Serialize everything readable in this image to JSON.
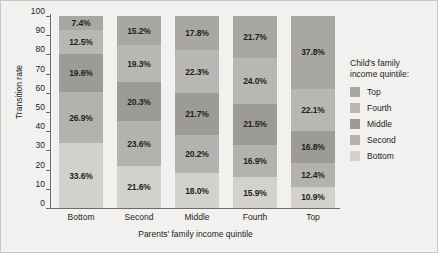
{
  "chart_data": {
    "type": "bar",
    "stacked": true,
    "title": "",
    "xlabel": "Parents' family income quintile",
    "ylabel": "Transition rate",
    "ylim": [
      0,
      100
    ],
    "yticks": [
      0,
      10,
      20,
      30,
      40,
      50,
      60,
      70,
      80,
      90,
      100
    ],
    "grid": false,
    "legend_position": "right",
    "legend_title": "Child's family income quintile:",
    "categories": [
      "Bottom",
      "Second",
      "Middle",
      "Fourth",
      "Top"
    ],
    "series": [
      {
        "name": "Bottom",
        "color": "#d3d1ce",
        "values": [
          33.6,
          21.6,
          18.0,
          15.9,
          10.9
        ]
      },
      {
        "name": "Second",
        "color": "#b4b2af",
        "values": [
          26.9,
          23.6,
          20.2,
          16.9,
          12.4
        ]
      },
      {
        "name": "Middle",
        "color": "#9d9b98",
        "values": [
          19.6,
          20.3,
          21.7,
          21.5,
          16.8
        ]
      },
      {
        "name": "Fourth",
        "color": "#b9b7b4",
        "values": [
          12.5,
          19.3,
          22.3,
          24.0,
          22.1
        ]
      },
      {
        "name": "Top",
        "color": "#a9a7a4",
        "values": [
          7.4,
          15.2,
          17.8,
          21.7,
          37.8
        ]
      }
    ],
    "bar_labels": [
      [
        "7.4%",
        "12.5%",
        "19.6%",
        "26.9%",
        "33.6%"
      ],
      [
        "15.2%",
        "19.3%",
        "20.3%",
        "23.6%",
        "21.6%"
      ],
      [
        "17.8%",
        "22.3%",
        "21.7%",
        "20.2%",
        "18.0%"
      ],
      [
        "21.7%",
        "24.0%",
        "21.5%",
        "16.9%",
        "15.9%"
      ],
      [
        "37.8%",
        "22.1%",
        "16.8%",
        "12.4%",
        "10.9%"
      ]
    ]
  },
  "legend": {
    "title_line1": "Child's family",
    "title_line2": "income quintile:",
    "items": [
      {
        "label": "Top",
        "color": "#a9a7a4"
      },
      {
        "label": "Fourth",
        "color": "#b9b7b4"
      },
      {
        "label": "Middle",
        "color": "#9d9b98"
      },
      {
        "label": "Second",
        "color": "#b4b2af"
      },
      {
        "label": "Bottom",
        "color": "#d3d1ce"
      }
    ]
  }
}
